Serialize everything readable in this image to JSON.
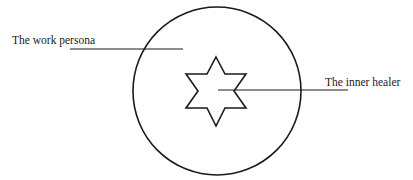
{
  "diagram": {
    "outer_circle": {
      "label": "The work persona",
      "cx": 217,
      "cy": 91,
      "r": 84
    },
    "inner_star": {
      "label": "The inner healer",
      "cx": 216,
      "cy": 91,
      "points": 6
    },
    "labels": [
      {
        "id": "work-persona",
        "text": "The work persona"
      },
      {
        "id": "inner-healer",
        "text": "The inner healer"
      }
    ],
    "colors": {
      "stroke": "#1a1a1a",
      "background": "#ffffff"
    }
  }
}
